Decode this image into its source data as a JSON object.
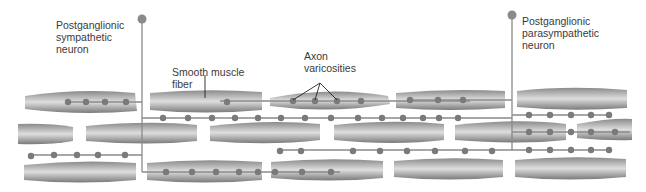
{
  "labels": {
    "sympathetic": "Postganglionic\nsympathetic\nneuron",
    "smooth_muscle": "Smooth muscle\nfiber",
    "varicosities": "Axon\nvaricosities",
    "parasympathetic": "Postganglionic\nparasympathetic\nneuron"
  },
  "colors": {
    "fiber_dark": "#7d7d7d",
    "fiber_light": "#d9d9d9",
    "axon": "#8a8a8a",
    "varicosity": "#7a7a7a",
    "leader": "#222222",
    "text": "#3a3a3a"
  }
}
